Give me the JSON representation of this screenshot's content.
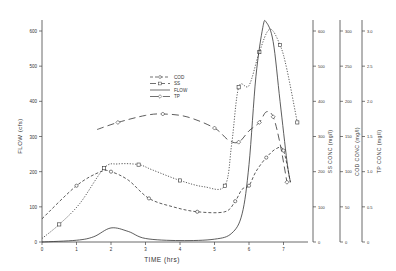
{
  "chart_data": {
    "type": "line",
    "title": "",
    "xlabel": "TIME (hrs)",
    "xlim": [
      0,
      7.5
    ],
    "x_ticks": [
      "0",
      "1",
      "2",
      "3",
      "4",
      "5",
      "6",
      "7"
    ],
    "grid": false,
    "legend_position": "upper center",
    "axes": [
      {
        "id": "flow",
        "label": "FLOW (cfs)",
        "side": "left",
        "ylim": [
          0,
          600
        ],
        "ticks": [
          "0",
          "100",
          "200",
          "300",
          "400",
          "500",
          "600"
        ]
      },
      {
        "id": "ss",
        "label": "SS CONC (mg/l)",
        "side": "right",
        "ylim": [
          0,
          600
        ],
        "ticks": [
          "0",
          "100",
          "200",
          "300",
          "400",
          "500",
          "600"
        ]
      },
      {
        "id": "cod",
        "label": "COD CONC (mg/l)",
        "side": "right",
        "ylim": [
          0,
          300
        ],
        "ticks": [
          "0",
          "50",
          "100",
          "150",
          "200",
          "250",
          "300"
        ]
      },
      {
        "id": "tp",
        "label": "TP CONC (mg/l)",
        "side": "right",
        "ylim": [
          0,
          3.0
        ],
        "ticks": [
          "0",
          "0.5",
          "1.0",
          "1.5",
          "2.0",
          "2.5",
          "3.0"
        ]
      }
    ],
    "series": [
      {
        "name": "COD",
        "axis": "cod",
        "style": "dash-dot",
        "marker": "circle",
        "x": [
          0,
          1.0,
          1.7,
          2.0,
          2.5,
          3.1,
          3.8,
          4.5,
          5.3,
          5.6,
          5.8,
          6.0,
          6.2,
          6.5,
          6.8,
          7.0,
          7.2
        ],
        "y": [
          33,
          80,
          100,
          100,
          88,
          62,
          50,
          43,
          43,
          58,
          75,
          80,
          100,
          120,
          133,
          130,
          85
        ]
      },
      {
        "name": "SS",
        "axis": "ss",
        "style": "dotted",
        "marker": "square",
        "x": [
          0,
          0.5,
          1.1,
          1.8,
          2.2,
          2.8,
          3.2,
          4.0,
          4.7,
          5.3,
          5.5,
          5.7,
          6.0,
          6.3,
          6.6,
          6.9,
          7.1,
          7.4
        ],
        "y": [
          10,
          50,
          110,
          210,
          222,
          220,
          205,
          175,
          157,
          160,
          280,
          440,
          445,
          540,
          605,
          560,
          490,
          340
        ]
      },
      {
        "name": "FLOW",
        "axis": "flow",
        "style": "solid",
        "marker": "none",
        "x": [
          0,
          1.0,
          1.5,
          2.0,
          2.5,
          3.0,
          4.0,
          5.0,
          5.5,
          5.8,
          6.0,
          6.2,
          6.4,
          6.5,
          6.7,
          6.9,
          7.1,
          7.2
        ],
        "y": [
          0,
          5,
          15,
          40,
          30,
          10,
          4,
          8,
          25,
          80,
          220,
          470,
          610,
          625,
          570,
          400,
          230,
          170
        ]
      },
      {
        "name": "TP",
        "axis": "tp",
        "style": "long-dash",
        "marker": "diamond",
        "x": [
          1.6,
          2.2,
          3.0,
          3.5,
          4.2,
          5.0,
          5.4,
          5.7,
          6.0,
          6.3,
          6.5,
          6.7,
          6.9,
          7.1
        ],
        "y": [
          1.6,
          1.7,
          1.8,
          1.82,
          1.78,
          1.62,
          1.45,
          1.42,
          1.58,
          1.7,
          1.85,
          1.78,
          1.4,
          0.85
        ]
      }
    ]
  },
  "legend": [
    {
      "label": "COD",
      "dash": "3,2",
      "marker": "circle"
    },
    {
      "label": "SS",
      "dash": "6,3",
      "marker": "square"
    },
    {
      "label": "FLOW",
      "dash": "",
      "marker": "none"
    },
    {
      "label": "TP",
      "dash": "9,4",
      "marker": "diamond"
    }
  ]
}
